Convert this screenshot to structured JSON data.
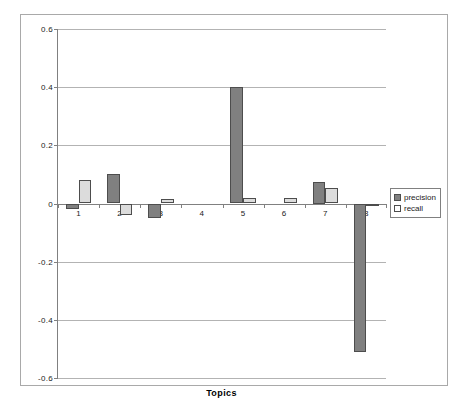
{
  "chart_data": {
    "type": "bar",
    "title": "",
    "xlabel": "Topics",
    "ylabel": "",
    "categories": [
      "1",
      "2",
      "3",
      "4",
      "5",
      "6",
      "7",
      "8"
    ],
    "series": [
      {
        "name": "precision",
        "color": "#808080",
        "values": [
          -0.02,
          0.1,
          -0.05,
          0.0,
          0.4,
          0.0,
          0.075,
          -0.51
        ]
      },
      {
        "name": "recall",
        "color": "#DCDCDC",
        "values": [
          0.08,
          -0.04,
          0.015,
          0.0,
          0.02,
          0.02,
          0.055,
          -0.01
        ]
      }
    ],
    "ylim": [
      -0.6,
      0.6
    ],
    "yticks": [
      "0.6",
      "0.4",
      "0.2",
      "0",
      "-0.2",
      "-0.4",
      "-0.6"
    ],
    "ytick_values": [
      0.6,
      0.4,
      0.2,
      0,
      -0.2,
      -0.4,
      -0.6
    ],
    "grid": true,
    "legend_position": "right",
    "legend_entries": [
      "precision",
      "recall"
    ]
  }
}
